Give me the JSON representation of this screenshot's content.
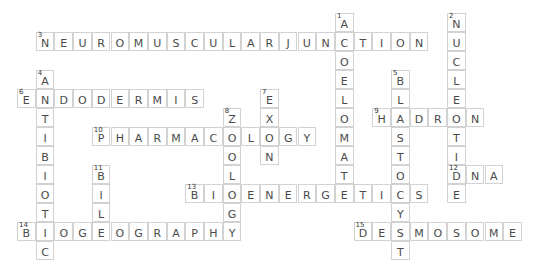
{
  "puzzle": {
    "type": "crossword",
    "words": [
      {
        "number": 1,
        "direction": "down",
        "answer": "ACOELOMATE",
        "row": 0,
        "col": 17
      },
      {
        "number": 2,
        "direction": "down",
        "answer": "NUCLEOTIDE",
        "row": 0,
        "col": 23
      },
      {
        "number": 3,
        "direction": "across",
        "answer": "NEUROMUSCULARJUNCTION",
        "row": 1,
        "col": 1
      },
      {
        "number": 4,
        "direction": "down",
        "answer": "ANTIBIOTIC",
        "row": 3,
        "col": 1
      },
      {
        "number": 5,
        "direction": "down",
        "answer": "BLASTOCYST",
        "row": 3,
        "col": 20
      },
      {
        "number": 6,
        "direction": "across",
        "answer": "ENDODERMIS",
        "row": 4,
        "col": 0
      },
      {
        "number": 7,
        "direction": "down",
        "answer": "EXON",
        "row": 4,
        "col": 13
      },
      {
        "number": 8,
        "direction": "down",
        "answer": "ZOOLOGY",
        "row": 5,
        "col": 11
      },
      {
        "number": 9,
        "direction": "across",
        "answer": "HADRON",
        "row": 5,
        "col": 19
      },
      {
        "number": 10,
        "direction": "across",
        "answer": "PHARMACOLOGY",
        "row": 6,
        "col": 4
      },
      {
        "number": 11,
        "direction": "down",
        "answer": "BILE",
        "row": 8,
        "col": 4
      },
      {
        "number": 12,
        "direction": "across",
        "answer": "DNA",
        "row": 8,
        "col": 23
      },
      {
        "number": 13,
        "direction": "across",
        "answer": "BIOENERGETICS",
        "row": 9,
        "col": 9
      },
      {
        "number": 14,
        "direction": "across",
        "answer": "BIOGEOGRAPHY",
        "row": 11,
        "col": 0
      },
      {
        "number": 15,
        "direction": "across",
        "answer": "DESMOSOME",
        "row": 11,
        "col": 18
      }
    ]
  },
  "colors": {
    "cell_border": "#d2d2d2",
    "letter": "#4a4a4a",
    "number": "#333333",
    "background": "#ffffff"
  }
}
